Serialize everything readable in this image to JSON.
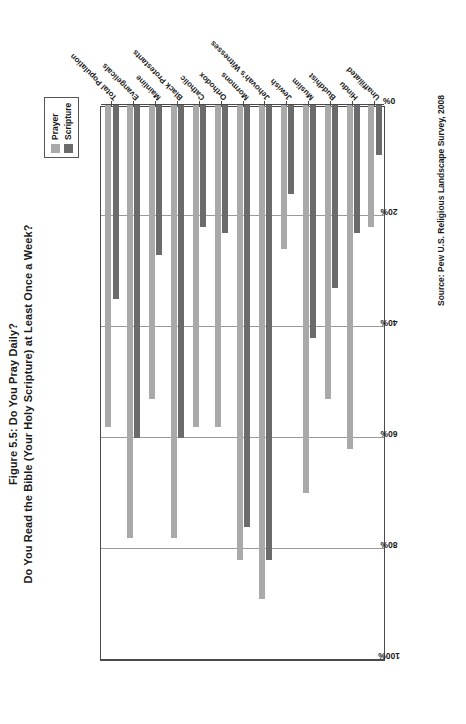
{
  "figure": {
    "title_line1": "Figure 5.5: Do You Pray Daily?",
    "title_line2": "Do You Read the Bible (Your Holy Scripture) at Least Once a Week?",
    "source": "Source: Pew U.S. Religious Landscape Survey, 2008"
  },
  "colors": {
    "prayer": "#a9a9a9",
    "scripture": "#6b6b6b",
    "gridline": "#9a9a9a",
    "axis": "#4a4a4a",
    "text": "#1a1a1a",
    "background": "#ffffff"
  },
  "legend": {
    "position": "top-right",
    "entries": [
      {
        "label": "Prayer",
        "color": "#a9a9a9"
      },
      {
        "label": "Scripture",
        "color": "#6b6b6b"
      }
    ]
  },
  "chart_data": {
    "type": "bar",
    "orientation": "horizontal",
    "title": "Figure 5.5: Do You Pray Daily? Do You Read the Bible (Your Holy Scripture) at Least Once a Week?",
    "xlabel": "",
    "ylabel": "",
    "xlim": [
      0,
      100
    ],
    "grid": true,
    "legend_position": "top-right",
    "tick_labels": [
      "0%",
      "20%",
      "40%",
      "60%",
      "80%",
      "100%"
    ],
    "tick_values": [
      0,
      20,
      40,
      60,
      80,
      100
    ],
    "categories": [
      "Total Population",
      "Evangelicals",
      "Mainline",
      "Black Protestants",
      "Catholic",
      "Orthodox",
      "Mormons",
      "Jehovah's Witnesses",
      "Jewish",
      "Muslim",
      "Buddhist",
      "Hindu",
      "Unaffiliated"
    ],
    "series": [
      {
        "name": "Prayer",
        "color": "#a9a9a9",
        "values": [
          58,
          78,
          53,
          78,
          58,
          58,
          82,
          89,
          26,
          70,
          53,
          62,
          22
        ]
      },
      {
        "name": "Scripture",
        "color": "#6b6b6b",
        "values": [
          35,
          60,
          27,
          60,
          22,
          23,
          76,
          82,
          16,
          42,
          33,
          23,
          9
        ]
      }
    ]
  }
}
